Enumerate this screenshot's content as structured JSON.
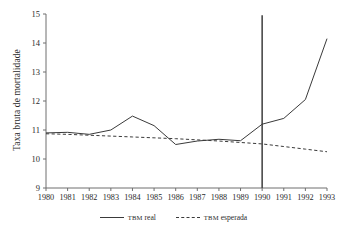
{
  "chart_data": {
    "type": "line",
    "title": "",
    "xlabel": "",
    "ylabel": "Taxa bruta de mortalidade",
    "x": [
      1980,
      1981,
      1982,
      1983,
      1984,
      1985,
      1986,
      1987,
      1988,
      1989,
      1990,
      1991,
      1992,
      1993
    ],
    "categories": [
      "1980",
      "1981",
      "1982",
      "1983",
      "1984",
      "1985",
      "1986",
      "1987",
      "1988",
      "1989",
      "1990",
      "1991",
      "1992",
      "1993"
    ],
    "xlim": [
      1980,
      1993
    ],
    "ylim": [
      9,
      15
    ],
    "yticks": [
      9,
      10,
      11,
      12,
      13,
      14,
      15
    ],
    "ytick_labels": [
      "9",
      "10",
      "11",
      "12",
      "13",
      "14",
      "15"
    ],
    "grid": false,
    "legend_position": "bottom-center",
    "series": [
      {
        "name": "TBM real",
        "name_prefix": "TBM",
        "name_suffix": "real",
        "style": "solid",
        "color": "#3a3a3a",
        "values": [
          10.9,
          10.92,
          10.85,
          11.0,
          11.48,
          11.15,
          10.5,
          10.62,
          10.68,
          10.63,
          11.2,
          11.4,
          12.05,
          14.15
        ]
      },
      {
        "name": "TBM esperada",
        "name_prefix": "TBM",
        "name_suffix": "esperada",
        "style": "dashed",
        "color": "#3a3a3a",
        "values": [
          10.87,
          10.85,
          10.82,
          10.79,
          10.76,
          10.73,
          10.7,
          10.66,
          10.62,
          10.57,
          10.52,
          10.43,
          10.34,
          10.25
        ]
      }
    ],
    "annotations": [
      {
        "name": "intervention-marker",
        "type": "vertical-line",
        "x": 1990,
        "y_from": 9,
        "y_to": 14.96,
        "color": "#4a4a4a"
      }
    ]
  },
  "axis": {
    "y_label": "Taxa bruta de mortalidade"
  },
  "legend": {
    "entries": [
      {
        "prefix": "TBM",
        "label": "real"
      },
      {
        "prefix": "TBM",
        "label": "esperada"
      }
    ]
  }
}
